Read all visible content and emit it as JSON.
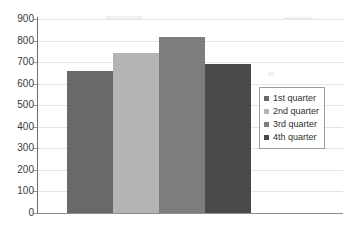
{
  "chart_data": {
    "type": "bar",
    "title": "",
    "subtitle": "",
    "xlabel": "",
    "ylabel": "",
    "categories": [
      "1st quarter",
      "2nd quarter",
      "3rd quarter",
      "4th quarter"
    ],
    "values": [
      660,
      740,
      815,
      690
    ],
    "ylim": [
      0,
      900
    ],
    "ytick_step": 100,
    "yticks": [
      900,
      800,
      700,
      600,
      500,
      400,
      300,
      200,
      100,
      0
    ],
    "ytick_labels": [
      "900",
      "800",
      "700",
      "600",
      "500",
      "400",
      "300",
      "200",
      "100",
      "0"
    ],
    "grid": true,
    "grid_axis": "y",
    "legend_position": "right",
    "legend": [
      {
        "label": "1st quarter",
        "color": "#696969"
      },
      {
        "label": "2nd quarter",
        "color": "#b4b4b4"
      },
      {
        "label": "3rd quarter",
        "color": "#7d7d7d"
      },
      {
        "label": "4th quarter",
        "color": "#4a4a4a"
      }
    ],
    "series": [
      {
        "name": "quarters",
        "points": [
          {
            "category": "1st quarter",
            "value": 660,
            "color": "#696969"
          },
          {
            "category": "2nd quarter",
            "value": 740,
            "color": "#b4b4b4"
          },
          {
            "category": "3rd quarter",
            "value": 815,
            "color": "#7d7d7d"
          },
          {
            "category": "4th quarter",
            "value": 690,
            "color": "#4a4a4a"
          }
        ]
      }
    ],
    "colors": {
      "axis": "#6e6e6e",
      "baseline": "#8d8d8d",
      "gridline": "#e4e4e4",
      "tick_label": "#3a3a3a",
      "legend_border": "#9b9b9b",
      "background": "#ffffff"
    }
  }
}
